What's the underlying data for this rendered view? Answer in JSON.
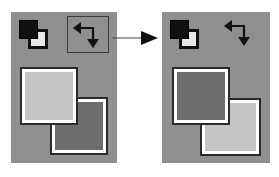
{
  "figure": {
    "colors": {
      "panel_bg": "#8f8f8f",
      "light_swatch": "#c4c4c4",
      "dark_swatch": "#6e6e6e",
      "swatch_outline": "#2a2a2a",
      "swatch_inner_border": "#ffffff",
      "icon_dark": "#111111"
    },
    "before": {
      "label": "before",
      "foreground_color": "#c4c4c4",
      "background_color": "#6e6e6e",
      "icons": [
        "default-colors-icon",
        "swap-colors-icon (highlighted)"
      ]
    },
    "after": {
      "label": "after",
      "foreground_color": "#6e6e6e",
      "background_color": "#c4c4c4",
      "icons": [
        "default-colors-icon",
        "swap-colors-icon"
      ]
    },
    "connector": "arrow-right"
  }
}
